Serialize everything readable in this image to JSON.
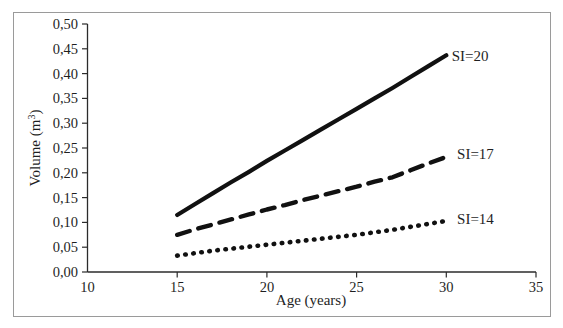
{
  "chart_data": {
    "type": "line",
    "title": "",
    "xlabel": "Age (years)",
    "ylabel": "Volume (m³)",
    "ylabel_base": "Volume (m",
    "ylabel_sup": "3",
    "ylabel_tail": ")",
    "xlim": [
      10,
      35
    ],
    "ylim": [
      0.0,
      0.5
    ],
    "grid": false,
    "legend_position": "inline-right-of-series",
    "decimal_separator": ",",
    "x_ticks": [
      10,
      15,
      20,
      25,
      30,
      35
    ],
    "x_tick_labels": [
      "10",
      "15",
      "20",
      "25",
      "30",
      "35"
    ],
    "y_ticks": [
      0.0,
      0.05,
      0.1,
      0.15,
      0.2,
      0.25,
      0.3,
      0.35,
      0.4,
      0.45,
      0.5
    ],
    "y_tick_labels": [
      "0,00",
      "0,05",
      "0,10",
      "0,15",
      "0,20",
      "0,25",
      "0,30",
      "0,35",
      "0,40",
      "0,45",
      "0,50"
    ],
    "x": [
      15,
      16,
      17,
      18,
      19,
      20,
      21,
      22,
      23,
      24,
      25,
      26,
      27,
      28,
      29,
      30
    ],
    "series": [
      {
        "name": "SI=20",
        "label": "SI=20",
        "style": "solid",
        "color": "#111111",
        "values": [
          0.115,
          0.137,
          0.159,
          0.181,
          0.202,
          0.224,
          0.245,
          0.266,
          0.287,
          0.308,
          0.329,
          0.35,
          0.371,
          0.393,
          0.415,
          0.437
        ]
      },
      {
        "name": "SI=17",
        "label": "SI=17",
        "style": "dashed",
        "color": "#111111",
        "values": [
          0.075,
          0.086,
          0.096,
          0.106,
          0.116,
          0.126,
          0.135,
          0.145,
          0.154,
          0.163,
          0.172,
          0.182,
          0.191,
          0.205,
          0.219,
          0.232
        ]
      },
      {
        "name": "SI=14",
        "label": "SI=14",
        "style": "dotted",
        "color": "#111111",
        "values": [
          0.033,
          0.038,
          0.043,
          0.047,
          0.051,
          0.055,
          0.059,
          0.063,
          0.067,
          0.071,
          0.075,
          0.08,
          0.085,
          0.091,
          0.097,
          0.103
        ]
      }
    ],
    "annotations": [
      {
        "text": "SI=20",
        "x": 30.3,
        "y": 0.435
      },
      {
        "text": "SI=17",
        "x": 30.6,
        "y": 0.238
      },
      {
        "text": "SI=14",
        "x": 30.6,
        "y": 0.107
      }
    ]
  }
}
